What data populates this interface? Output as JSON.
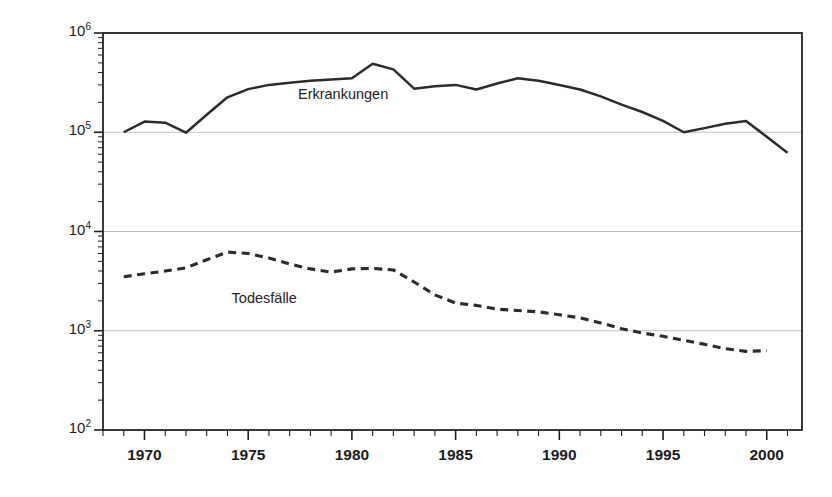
{
  "chart_data": {
    "type": "line",
    "title": "",
    "xlabel": "",
    "ylabel": "gemeldete Malaria-Fälle",
    "yscale": "log",
    "ylim": [
      100,
      1000000
    ],
    "xlim": [
      1968,
      2001.7
    ],
    "grid": true,
    "gridlines_y": [
      100,
      1000,
      10000,
      100000,
      1000000
    ],
    "legend_position": "inline-annotations",
    "ytick_labels": [
      "10^2",
      "10^3",
      "10^4",
      "10^5",
      "10^6"
    ],
    "ytick_mantissa": [
      "10",
      "10",
      "10",
      "10",
      "10"
    ],
    "ytick_exponents": [
      "2",
      "3",
      "4",
      "5",
      "6"
    ],
    "xtick_labels": [
      "1970",
      "1975",
      "1980",
      "1985",
      "1990",
      "1995",
      "2000"
    ],
    "xtick_values": [
      1970,
      1975,
      1980,
      1985,
      1990,
      1995,
      2000
    ],
    "xminor_step": 1,
    "series": [
      {
        "name": "Erkrankungen",
        "style": "solid",
        "color": "#2b2b2b",
        "label_x": 1977.4,
        "label_y": 230000,
        "x": [
          1969,
          1970,
          1971,
          1972,
          1973,
          1974,
          1975,
          1976,
          1977,
          1978,
          1979,
          1980,
          1981,
          1982,
          1983,
          1984,
          1985,
          1986,
          1987,
          1988,
          1989,
          1990,
          1991,
          1992,
          1993,
          1994,
          1995,
          1996,
          1997,
          1998,
          1999,
          2000,
          2001
        ],
        "y": [
          100000,
          128000,
          125000,
          99000,
          150000,
          225000,
          272000,
          300000,
          315000,
          330000,
          340000,
          350000,
          490000,
          430000,
          275000,
          290000,
          300000,
          270000,
          310000,
          350000,
          330000,
          300000,
          270000,
          230000,
          190000,
          160000,
          130000,
          100000,
          110000,
          122000,
          130000,
          90000,
          62000
        ]
      },
      {
        "name": "Todesfälle",
        "style": "dashed",
        "color": "#2b2b2b",
        "label_x": 1974.2,
        "label_y": 2050,
        "x": [
          1969,
          1970,
          1971,
          1972,
          1973,
          1974,
          1975,
          1976,
          1977,
          1978,
          1979,
          1980,
          1981,
          1982,
          1983,
          1984,
          1985,
          1986,
          1987,
          1988,
          1989,
          1990,
          1991,
          1992,
          1993,
          1994,
          1995,
          1996,
          1997,
          1998,
          1999,
          2000
        ],
        "y": [
          3500,
          3750,
          4000,
          4300,
          5200,
          6200,
          6000,
          5400,
          4700,
          4200,
          3900,
          4200,
          4250,
          4100,
          3100,
          2300,
          1900,
          1800,
          1650,
          1600,
          1550,
          1450,
          1350,
          1200,
          1050,
          950,
          880,
          800,
          730,
          660,
          620,
          630
        ]
      }
    ]
  },
  "axis_geometry": {
    "plot_left": 103,
    "plot_right": 802,
    "plot_top": 33,
    "plot_bottom": 430
  }
}
